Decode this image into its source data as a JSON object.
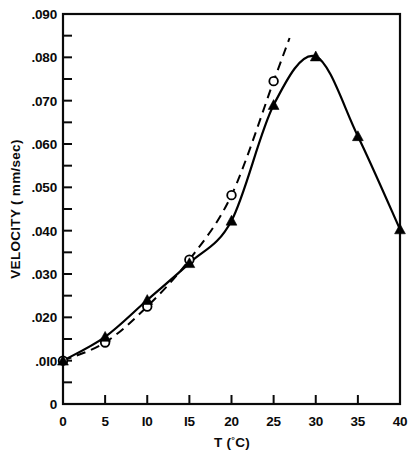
{
  "chart_data": {
    "type": "line",
    "title": "",
    "xlabel": "T (°C)",
    "ylabel": "VELOCITY ( mm/sec)",
    "xlim": [
      0,
      40
    ],
    "ylim": [
      0,
      0.09
    ],
    "grid": false,
    "legend": "none",
    "x_ticks": [
      0,
      5,
      10,
      15,
      20,
      25,
      30,
      35,
      40
    ],
    "x_tick_labels": [
      "0",
      "5",
      "I0",
      "I5",
      "20",
      "25",
      "30",
      "35",
      "40"
    ],
    "y_ticks": [
      0,
      0.01,
      0.02,
      0.03,
      0.04,
      0.05,
      0.06,
      0.07,
      0.08,
      0.09
    ],
    "y_tick_labels": [
      "0",
      ".0I0",
      ".020",
      ".030",
      ".040",
      ".050",
      ".060",
      ".070",
      ".080",
      ".090"
    ],
    "y_minor_ticks": [
      0.005,
      0.015,
      0.025,
      0.035,
      0.045,
      0.055,
      0.065,
      0.075,
      0.085
    ],
    "series": [
      {
        "name": "solid-triangles",
        "marker": "filled-triangle",
        "line": "solid",
        "color": "#000000",
        "x": [
          0,
          5,
          10,
          15,
          20,
          25,
          30,
          35,
          40
        ],
        "values": [
          0.01,
          0.0155,
          0.024,
          0.0325,
          0.0423,
          0.069,
          0.0802,
          0.0618,
          0.0403
        ]
      },
      {
        "name": "dashed-open-circles",
        "marker": "open-circle",
        "line": "dashed",
        "color": "#000000",
        "x": [
          0,
          5,
          10,
          15,
          20,
          25
        ],
        "values": [
          0.01,
          0.0142,
          0.0225,
          0.0333,
          0.0482,
          0.0745
        ]
      }
    ]
  },
  "axes": {
    "x_axis_title": "T (°C)",
    "x_axis_title_main": "T (",
    "x_axis_title_deg": "°",
    "x_axis_title_unit": "C)",
    "y_axis_title": "VELOCITY ( mm/sec)"
  }
}
